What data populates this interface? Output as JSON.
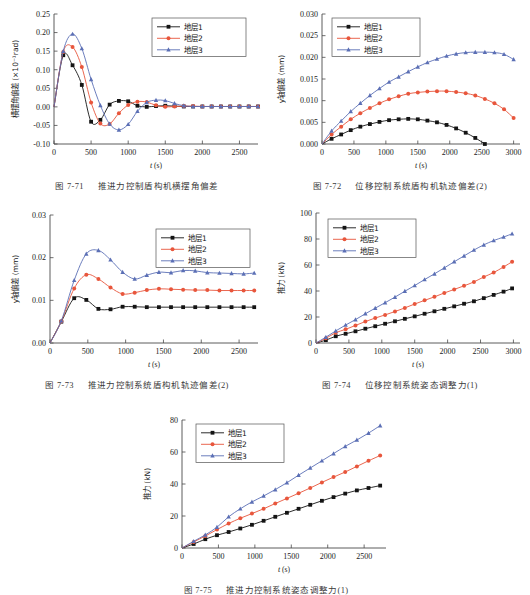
{
  "page": {
    "background": "#ffffff",
    "colors": {
      "series1": "#141414",
      "series2": "#e8563c",
      "series3": "#5b6fb5",
      "axis": "#4a4a4a",
      "text": "#1a1a1a",
      "caption": "#3a3a3a"
    },
    "legend_labels": [
      "地层1",
      "地层2",
      "地层3"
    ],
    "markers": [
      "square",
      "circle",
      "triangle"
    ]
  },
  "figures": [
    {
      "id": "fig-7-71",
      "caption_number": "图 7-71",
      "caption_text": "推进力控制盾构机横摆角偏差",
      "chart_data": {
        "type": "line",
        "title": "",
        "xlabel": "t (s)",
        "ylabel": "横摆角偏差 (×10⁻¹rad)",
        "ylabel_cn": "横摆角偏差",
        "ylabel_unit": "(×10⁻¹rad)",
        "xlim": [
          0,
          2750
        ],
        "ylim": [
          -0.1,
          0.25
        ],
        "xticks": [
          0,
          500,
          1000,
          1500,
          2000,
          2500
        ],
        "yticks": [
          -0.1,
          -0.05,
          0.0,
          0.05,
          0.1,
          0.15,
          0.2,
          0.25
        ],
        "ytick_labels": [
          "-0.10",
          "-0.05",
          "0.00",
          "0.05",
          "0.10",
          "0.15",
          "0.20",
          "0.25"
        ],
        "xtick_labels": [
          "0",
          "500",
          "1000",
          "1500",
          "2000",
          "2500"
        ],
        "grid": false,
        "legend_position": "top-right",
        "x": [
          0,
          125,
          250,
          375,
          500,
          625,
          750,
          875,
          1000,
          1125,
          1250,
          1375,
          1500,
          1625,
          1750,
          1875,
          2000,
          2125,
          2250,
          2375,
          2500,
          2625,
          2750
        ],
        "series": [
          {
            "name": "地层1",
            "color": "#141414",
            "marker": "square",
            "values": [
              0.0,
              0.139,
              0.112,
              0.059,
              -0.04,
              -0.035,
              0.006,
              0.016,
              0.015,
              0.003,
              0.0,
              0.002,
              0.003,
              0.002,
              0.001,
              0.001,
              0.001,
              0.001,
              0.001,
              0.001,
              0.001,
              0.001,
              0.001
            ]
          },
          {
            "name": "地层2",
            "color": "#e8563c",
            "marker": "circle",
            "values": [
              0.0,
              0.148,
              0.161,
              0.107,
              0.012,
              -0.045,
              -0.046,
              -0.017,
              0.005,
              0.014,
              0.013,
              0.004,
              0.0,
              0.001,
              0.002,
              0.002,
              0.001,
              0.001,
              0.001,
              0.001,
              0.001,
              0.001,
              0.001
            ]
          },
          {
            "name": "地层3",
            "color": "#5b6fb5",
            "marker": "triangle",
            "values": [
              0.0,
              0.15,
              0.196,
              0.157,
              0.074,
              0.004,
              -0.046,
              -0.062,
              -0.047,
              -0.012,
              0.012,
              0.018,
              0.017,
              0.009,
              0.003,
              0.001,
              0.001,
              0.001,
              0.001,
              0.001,
              0.001,
              0.001,
              0.001
            ]
          }
        ]
      }
    },
    {
      "id": "fig-7-72",
      "caption_number": "图 7-72",
      "caption_text": "位移控制系统盾构机轨迹偏差(2)",
      "chart_data": {
        "type": "line",
        "title": "",
        "xlabel": "t (s)",
        "ylabel": "y轴偏差 (mm)",
        "ylabel_cn": "轴偏差",
        "ylabel_unit": "(mm)",
        "xlim": [
          0,
          3100
        ],
        "ylim": [
          0.0,
          0.03
        ],
        "xticks": [
          0,
          500,
          1000,
          1500,
          2000,
          2500,
          3000
        ],
        "yticks": [
          0.0,
          0.005,
          0.01,
          0.015,
          0.02,
          0.025,
          0.03
        ],
        "ytick_labels": [
          "0.000",
          "0.005",
          "0.010",
          "0.015",
          "0.020",
          "0.025",
          "0.030"
        ],
        "xtick_labels": [
          "0",
          "500",
          "1000",
          "1500",
          "2000",
          "2500",
          "3000"
        ],
        "grid": false,
        "legend_position": "top-left",
        "x": [
          0,
          150,
          300,
          450,
          600,
          750,
          900,
          1050,
          1200,
          1350,
          1500,
          1650,
          1800,
          1950,
          2100,
          2250,
          2400,
          2550,
          2700,
          2850,
          3000
        ],
        "series": [
          {
            "name": "地层1",
            "color": "#141414",
            "marker": "square",
            "values": [
              0.0,
              0.0012,
              0.0022,
              0.0032,
              0.004,
              0.0046,
              0.0051,
              0.0055,
              0.0057,
              0.0058,
              0.0057,
              0.0054,
              0.005,
              0.0044,
              0.0036,
              0.0026,
              0.0014,
              0.0,
              null,
              null,
              null
            ]
          },
          {
            "name": "地层2",
            "color": "#e8563c",
            "marker": "circle",
            "values": [
              0.0,
              0.0022,
              0.004,
              0.0057,
              0.0071,
              0.0083,
              0.0094,
              0.0103,
              0.011,
              0.0116,
              0.0119,
              0.0121,
              0.0122,
              0.0122,
              0.012,
              0.0117,
              0.0112,
              0.0104,
              0.0094,
              0.008,
              0.006
            ]
          },
          {
            "name": "地层3",
            "color": "#5b6fb5",
            "marker": "triangle",
            "values": [
              0.0,
              0.003,
              0.0053,
              0.0075,
              0.0094,
              0.0112,
              0.0128,
              0.0143,
              0.0155,
              0.0167,
              0.0178,
              0.0188,
              0.0196,
              0.0203,
              0.0208,
              0.0211,
              0.0212,
              0.0212,
              0.0211,
              0.0207,
              0.0195
            ]
          }
        ]
      }
    },
    {
      "id": "fig-7-73",
      "caption_number": "图 7-73",
      "caption_text": "推进力控制系统盾构机轨迹偏差(2)",
      "chart_data": {
        "type": "line",
        "title": "",
        "xlabel": "t (s)",
        "ylabel": "y轴偏差 (mm)",
        "ylabel_cn": "轴偏差",
        "ylabel_unit": "(mm)",
        "xlim": [
          0,
          2750
        ],
        "ylim": [
          0.0,
          0.03
        ],
        "xticks": [
          0,
          500,
          1000,
          1500,
          2000,
          2500
        ],
        "yticks": [
          0.0,
          0.01,
          0.02,
          0.03
        ],
        "ytick_labels": [
          "0.00",
          "0.01",
          "0.02",
          "0.03"
        ],
        "xtick_labels": [
          "0",
          "500",
          "1000",
          "1500",
          "2000",
          "2500"
        ],
        "grid": false,
        "legend_position": "top-right",
        "x": [
          0,
          150,
          320,
          480,
          640,
          800,
          960,
          1120,
          1280,
          1440,
          1600,
          1760,
          1920,
          2080,
          2240,
          2400,
          2560,
          2700
        ],
        "series": [
          {
            "name": "地层1",
            "color": "#141414",
            "marker": "square",
            "values": [
              0.0,
              0.005,
              0.0105,
              0.0101,
              0.008,
              0.0079,
              0.0085,
              0.0085,
              0.0084,
              0.0084,
              0.0084,
              0.0084,
              0.0084,
              0.0084,
              0.0084,
              0.0084,
              0.0084,
              0.0084
            ]
          },
          {
            "name": "地层2",
            "color": "#e8563c",
            "marker": "circle",
            "values": [
              0.0,
              0.0051,
              0.0128,
              0.016,
              0.015,
              0.013,
              0.0115,
              0.0118,
              0.0124,
              0.0127,
              0.0126,
              0.0125,
              0.0124,
              0.0124,
              0.0123,
              0.0123,
              0.0123,
              0.0123
            ]
          },
          {
            "name": "地层3",
            "color": "#5b6fb5",
            "marker": "triangle",
            "values": [
              0.0,
              0.0052,
              0.0147,
              0.0209,
              0.0217,
              0.0195,
              0.0166,
              0.015,
              0.0159,
              0.0166,
              0.0165,
              0.017,
              0.0169,
              0.0165,
              0.0164,
              0.0163,
              0.0162,
              0.0164
            ]
          }
        ]
      }
    },
    {
      "id": "fig-7-74",
      "caption_number": "图 7-74",
      "caption_text": "位移控制系统姿态调整力(1)",
      "chart_data": {
        "type": "line",
        "title": "",
        "xlabel": "t (s)",
        "ylabel": "推力 (kN)",
        "ylabel_cn": "推力",
        "ylabel_unit": "(kN)",
        "xlim": [
          0,
          3100
        ],
        "ylim": [
          0,
          100
        ],
        "xticks": [
          0,
          500,
          1000,
          1500,
          2000,
          2500,
          3000
        ],
        "yticks": [
          0,
          20,
          40,
          60,
          80,
          100
        ],
        "ytick_labels": [
          "0",
          "20",
          "40",
          "60",
          "80",
          "100"
        ],
        "xtick_labels": [
          "0",
          "500",
          "1000",
          "1500",
          "2000",
          "2500",
          "3000"
        ],
        "grid": false,
        "legend_position": "top-left",
        "x": [
          0,
          150,
          300,
          450,
          600,
          750,
          900,
          1050,
          1200,
          1350,
          1500,
          1650,
          1800,
          1950,
          2100,
          2250,
          2400,
          2550,
          2700,
          2850,
          2980
        ],
        "series": [
          {
            "name": "地层1",
            "color": "#141414",
            "marker": "square",
            "values": [
              0.0,
              2.2,
              5.2,
              7.1,
              9.0,
              11.0,
              12.9,
              14.8,
              16.7,
              18.6,
              20.5,
              22.5,
              24.4,
              26.3,
              28.2,
              30.2,
              32.1,
              34.5,
              37.0,
              39.5,
              42.0
            ]
          },
          {
            "name": "地层2",
            "color": "#e8563c",
            "marker": "circle",
            "values": [
              0.0,
              3.6,
              7.9,
              10.5,
              13.5,
              16.5,
              19.2,
              21.6,
              24.2,
              27.0,
              30.0,
              32.8,
              35.5,
              38.5,
              41.2,
              44.0,
              47.0,
              50.8,
              54.2,
              58.5,
              62.5
            ]
          },
          {
            "name": "地层3",
            "color": "#5b6fb5",
            "marker": "triangle",
            "values": [
              0.0,
              4.5,
              9.3,
              13.8,
              18.0,
              22.5,
              26.8,
              31.0,
              35.3,
              39.8,
              44.2,
              48.8,
              53.2,
              57.8,
              62.5,
              67.0,
              71.5,
              75.5,
              78.8,
              81.5,
              84.0
            ]
          }
        ]
      }
    },
    {
      "id": "fig-7-75",
      "caption_number": "图 7-75",
      "caption_text": "推进力控制系统姿态调整力(1)",
      "chart_data": {
        "type": "line",
        "title": "",
        "xlabel": "t (s)",
        "ylabel": "推力 (kN)",
        "ylabel_cn": "推力",
        "ylabel_unit": "(kN)",
        "xlim": [
          0,
          2800
        ],
        "ylim": [
          0,
          80
        ],
        "xticks": [
          0,
          500,
          1000,
          1500,
          2000,
          2500
        ],
        "yticks": [
          0,
          20,
          40,
          60,
          80
        ],
        "ytick_labels": [
          "0",
          "20",
          "40",
          "60",
          "80"
        ],
        "xtick_labels": [
          "0",
          "500",
          "1000",
          "1500",
          "2000",
          "2500"
        ],
        "grid": false,
        "legend_position": "top-left",
        "x": [
          0,
          160,
          320,
          480,
          640,
          800,
          960,
          1120,
          1280,
          1440,
          1600,
          1760,
          1920,
          2080,
          2240,
          2400,
          2560,
          2720
        ],
        "series": [
          {
            "name": "地层1",
            "color": "#141414",
            "marker": "square",
            "values": [
              0.0,
              2.5,
              5.5,
              8.0,
              10.0,
              12.2,
              14.5,
              17.0,
              19.5,
              22.0,
              24.5,
              27.0,
              29.5,
              31.8,
              34.0,
              36.0,
              37.5,
              39.0
            ]
          },
          {
            "name": "地层2",
            "color": "#e8563c",
            "marker": "circle",
            "values": [
              0.0,
              3.8,
              7.5,
              11.5,
              15.3,
              18.6,
              21.5,
              24.5,
              27.8,
              31.0,
              34.2,
              37.5,
              41.0,
              44.3,
              47.5,
              51.0,
              54.5,
              57.8
            ]
          },
          {
            "name": "地层3",
            "color": "#5b6fb5",
            "marker": "triangle",
            "values": [
              0.0,
              4.2,
              8.2,
              13.0,
              19.5,
              24.5,
              28.8,
              32.5,
              36.5,
              40.8,
              45.5,
              50.0,
              54.5,
              59.0,
              63.5,
              67.5,
              71.8,
              76.5
            ]
          }
        ]
      }
    }
  ]
}
